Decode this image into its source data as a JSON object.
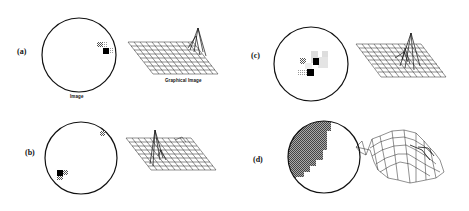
{
  "figure": {
    "panels": [
      {
        "id": "a",
        "label": "(a)",
        "image_caption": "Image",
        "graph_caption": "Graphical Image"
      },
      {
        "id": "b",
        "label": "(b)"
      },
      {
        "id": "c",
        "label": "(c)"
      },
      {
        "id": "d",
        "label": "(d)"
      }
    ]
  }
}
